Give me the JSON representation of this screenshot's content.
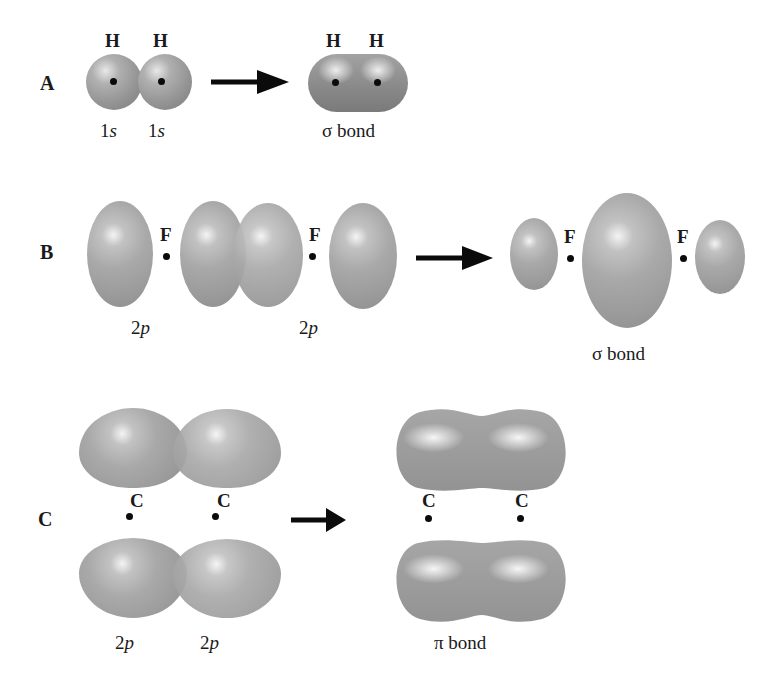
{
  "figure": {
    "panels": [
      {
        "id": "A",
        "label": "A",
        "reactants": {
          "atoms": [
            "H",
            "H"
          ],
          "orbitals": [
            "1s",
            "1s"
          ],
          "orbital_labels": [
            {
              "num": "1",
              "letter": "s"
            },
            {
              "num": "1",
              "letter": "s"
            }
          ]
        },
        "product": {
          "atoms": [
            "H",
            "H"
          ],
          "bond": "σ bond"
        }
      },
      {
        "id": "B",
        "label": "B",
        "reactants": {
          "atoms": [
            "F",
            "F"
          ],
          "orbitals": [
            "2p",
            "2p"
          ],
          "orbital_labels": [
            {
              "num": "2",
              "letter": "p"
            },
            {
              "num": "2",
              "letter": "p"
            }
          ]
        },
        "product": {
          "atoms": [
            "F",
            "F"
          ],
          "bond": "σ bond"
        }
      },
      {
        "id": "C",
        "label": "C",
        "reactants": {
          "atoms": [
            "C",
            "C"
          ],
          "orbitals": [
            "2p",
            "2p"
          ],
          "orbital_labels": [
            {
              "num": "2",
              "letter": "p"
            },
            {
              "num": "2",
              "letter": "p"
            }
          ]
        },
        "product": {
          "atoms": [
            "C",
            "C"
          ],
          "bond": "π bond"
        }
      }
    ],
    "colors": {
      "orbital_gray": "#9a9a9a",
      "highlight": "#f4f4f4",
      "arrow": "#0b0b0b",
      "text": "#1a1a1a"
    }
  }
}
